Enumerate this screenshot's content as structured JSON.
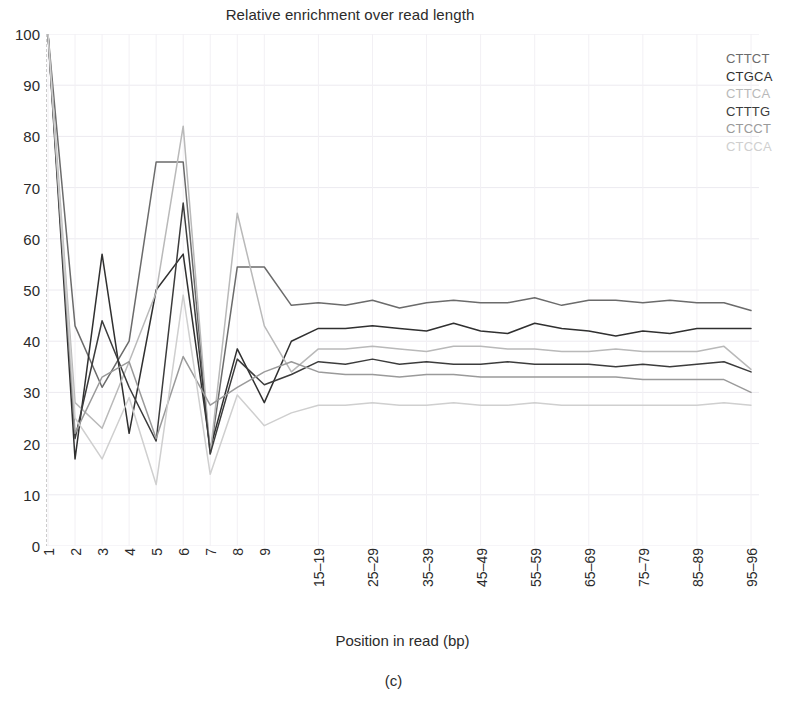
{
  "figure": {
    "title": "Relative enrichment over read length",
    "caption": "(c)"
  },
  "axes": {
    "xlabel": "Position in read (bp)",
    "ylabel": ""
  },
  "legend": {
    "position": "right",
    "entries": [
      {
        "label": "CTTCT",
        "color": "#6b6b6b"
      },
      {
        "label": "CTGCA",
        "color": "#303030"
      },
      {
        "label": "CTTCA",
        "color": "#b9b9b9"
      },
      {
        "label": "CTTTG",
        "color": "#3c3c3c"
      },
      {
        "label": "CTCCT",
        "color": "#9a9a9a"
      },
      {
        "label": "CTCCA",
        "color": "#cfcfcf"
      }
    ]
  },
  "chart_data": {
    "type": "line",
    "title": "Relative enrichment over read length",
    "xlabel": "Position in read (bp)",
    "ylabel": "",
    "grid": true,
    "legend_position": "right",
    "ylim": [
      0,
      100
    ],
    "yticks": [
      0,
      10,
      20,
      30,
      40,
      50,
      60,
      70,
      80,
      90,
      100
    ],
    "categories": [
      "1",
      "2",
      "3",
      "4",
      "5",
      "6",
      "7",
      "8",
      "9",
      "10-14",
      "15-19",
      "20-24",
      "25-29",
      "30-34",
      "35-39",
      "40-44",
      "45-49",
      "50-54",
      "55-59",
      "60-64",
      "65-69",
      "70-74",
      "75-79",
      "80-84",
      "85-89",
      "90-94",
      "95-96"
    ],
    "xtick_labels": [
      "1",
      "2",
      "3",
      "4",
      "5",
      "6",
      "7",
      "8",
      "9",
      "",
      "15–19",
      "",
      "25–29",
      "",
      "35–39",
      "",
      "45–49",
      "",
      "55–59",
      "",
      "65–69",
      "",
      "75–79",
      "",
      "85–89",
      "",
      "95–96"
    ],
    "series": [
      {
        "name": "CTTCT",
        "color": "#6b6b6b",
        "values": [
          100,
          43,
          31,
          40,
          75,
          75,
          18,
          54.5,
          54.5,
          47,
          47.5,
          47,
          48,
          46.5,
          47.5,
          48,
          47.5,
          47.5,
          48.5,
          47,
          48,
          48,
          47.5,
          48,
          47.5,
          47.5,
          46
        ]
      },
      {
        "name": "CTGCA",
        "color": "#303030",
        "values": [
          100,
          17,
          57,
          22,
          50,
          57,
          19,
          38.5,
          28,
          40,
          42.5,
          42.5,
          43,
          42.5,
          42,
          43.5,
          42,
          41.5,
          43.5,
          42.5,
          42,
          41,
          42,
          41.5,
          42.5,
          42.5,
          42.5
        ]
      },
      {
        "name": "CTTCA",
        "color": "#b9b9b9",
        "values": [
          100,
          28,
          23,
          36,
          49.5,
          82,
          18,
          65,
          43,
          34,
          38.5,
          38.5,
          39,
          38.5,
          38,
          39,
          39,
          38.5,
          38.5,
          38,
          38,
          38.5,
          38,
          38,
          38,
          39,
          34.5
        ]
      },
      {
        "name": "CTTTG",
        "color": "#3c3c3c",
        "values": [
          100,
          21,
          44,
          31,
          20.5,
          67,
          18,
          36.5,
          31.5,
          33.5,
          36,
          35.5,
          36.5,
          35.5,
          36,
          35.5,
          35.5,
          36,
          35.5,
          35.5,
          35.5,
          35,
          35.5,
          35,
          35.5,
          36,
          34
        ]
      },
      {
        "name": "CTCCT",
        "color": "#9a9a9a",
        "values": [
          100,
          22,
          33,
          36,
          21,
          37,
          27.5,
          31,
          34,
          36,
          34,
          33.5,
          33.5,
          33,
          33.5,
          33.5,
          33,
          33,
          33,
          33,
          33,
          33,
          32.5,
          32.5,
          32.5,
          32.5,
          30
        ]
      },
      {
        "name": "CTCCA",
        "color": "#cfcfcf",
        "values": [
          100,
          25,
          17,
          29,
          12,
          49,
          14,
          29.5,
          23.5,
          26,
          27.5,
          27.5,
          28,
          27.5,
          27.5,
          28,
          27.5,
          27.5,
          28,
          27.5,
          27.5,
          27.5,
          27.5,
          27.5,
          27.5,
          28,
          27.5
        ]
      }
    ]
  }
}
